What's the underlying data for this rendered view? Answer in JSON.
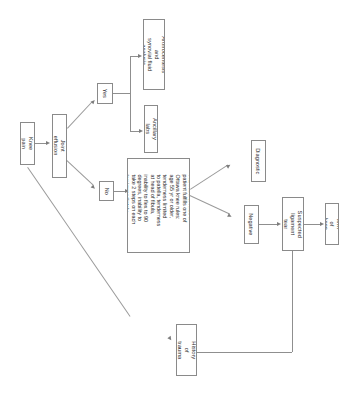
{
  "figure": {
    "orientation": "rotated-90-clockwise",
    "background_color": "#ffffff",
    "box_border_color": "#8a8a8a",
    "edge_color": "#8f8f8f",
    "text_color": "#2b2b2b",
    "top_edge_artifact": "",
    "nodes": [
      {
        "id": "knee_pain",
        "label": "Knee pain"
      },
      {
        "id": "joint_effusion",
        "label": "Joint effusion"
      },
      {
        "id": "yes",
        "label": "Yes"
      },
      {
        "id": "no",
        "label": "No"
      },
      {
        "id": "arthrocentesis",
        "label": "Arthrocentesis and\nsynovial fluid analysis"
      },
      {
        "id": "ancillary_labs",
        "label": "Ancillary labs"
      },
      {
        "id": "plain_film",
        "label": "Plain film of knee if\npatient fulfills one of\nOttawa knee rules:\nage 55 yr or older,\ntenderness limited\nto patella, tenderness\nat head of fibula,\ninability to flex to 90\ndegrees, inability to\ntake 2 steps on each\nleg immediately"
      },
      {
        "id": "diagnostic",
        "label": "Diagnostic"
      },
      {
        "id": "negative",
        "label": "Negative"
      },
      {
        "id": "suspected_tear",
        "label": "Suspected\nligament tear"
      },
      {
        "id": "mri",
        "label": "MRI of knee"
      },
      {
        "id": "history_trauma",
        "label": "History of\ntrauma"
      }
    ],
    "edges": [
      {
        "from": "knee_pain",
        "to": "joint_effusion"
      },
      {
        "from": "joint_effusion",
        "to": "yes"
      },
      {
        "from": "joint_effusion",
        "to": "no"
      },
      {
        "from": "yes",
        "to": "arthrocentesis"
      },
      {
        "from": "yes",
        "to": "ancillary_labs"
      },
      {
        "from": "no",
        "to": "plain_film"
      },
      {
        "from": "plain_film",
        "to": "diagnostic"
      },
      {
        "from": "plain_film",
        "to": "negative"
      },
      {
        "from": "negative",
        "to": "suspected_tear"
      },
      {
        "from": "suspected_tear",
        "to": "mri"
      },
      {
        "from": "knee_pain",
        "to": "history_trauma"
      },
      {
        "from": "history_trauma",
        "to": "suspected_tear"
      }
    ]
  }
}
